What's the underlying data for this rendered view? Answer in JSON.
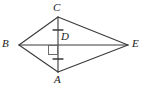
{
  "figure": {
    "shape_type": "kite",
    "background_color": "#ffffff",
    "stroke_color": "#3a3a3a",
    "label_color": "#1a1a1a",
    "labels": {
      "B": "B",
      "C": "C",
      "E": "E",
      "A": "A",
      "D": "D"
    },
    "points": {
      "B": {
        "x": 19,
        "y": 45
      },
      "C": {
        "x": 58,
        "y": 17
      },
      "E": {
        "x": 128,
        "y": 45
      },
      "A": {
        "x": 58,
        "y": 72
      },
      "D": {
        "x": 58,
        "y": 45
      }
    },
    "edges": [
      {
        "name": "BC",
        "from": "B",
        "to": "C"
      },
      {
        "name": "CE",
        "from": "C",
        "to": "E"
      },
      {
        "name": "EA",
        "from": "E",
        "to": "A"
      },
      {
        "name": "AB",
        "from": "A",
        "to": "B"
      }
    ],
    "diagonals": [
      {
        "name": "BE",
        "from": "B",
        "to": "E"
      },
      {
        "name": "CA",
        "from": "C",
        "to": "A"
      }
    ],
    "right_angle_mark": {
      "at": "D",
      "quadrant": "lower-left",
      "size": 9
    },
    "congruence_ticks": [
      {
        "segment": "CD",
        "count": 1,
        "x": 58,
        "y": 30
      },
      {
        "segment": "DA",
        "count": 1,
        "x": 58,
        "y": 59
      }
    ]
  }
}
